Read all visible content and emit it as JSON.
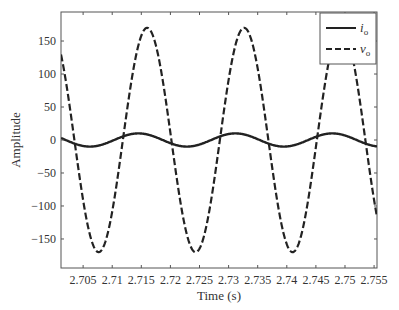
{
  "chart_data": {
    "type": "line",
    "title": "",
    "xlabel": "Time (s)",
    "ylabel": "Amplitude",
    "xlim": [
      2.7012,
      2.7555
    ],
    "ylim": [
      -194,
      194
    ],
    "grid": false,
    "legend_position": "upper right",
    "x_ticks": [
      2.705,
      2.71,
      2.715,
      2.72,
      2.725,
      2.73,
      2.735,
      2.74,
      2.745,
      2.75,
      2.755
    ],
    "x_tick_labels": [
      "2.705",
      "2.71",
      "2.715",
      "2.72",
      "2.725",
      "2.73",
      "2.735",
      "2.74",
      "2.745",
      "2.75",
      "2.755"
    ],
    "y_ticks": [
      150,
      100,
      50,
      0,
      -50,
      -100,
      -150
    ],
    "y_tick_labels": [
      "150",
      "100",
      "50",
      "0",
      "−50",
      "−100",
      "−150"
    ],
    "series": [
      {
        "name": "i_o",
        "legend_label": "i",
        "legend_sub": "o",
        "style": "solid",
        "color": "#222222",
        "waveform": {
          "amplitude": 10,
          "frequency_hz": 60,
          "peak_time": 2.7145
        },
        "x": [
          2.7012,
          2.7057,
          2.7099,
          2.7145,
          2.7187,
          2.7224,
          2.7266,
          2.7312,
          2.7354,
          2.7391,
          2.7433,
          2.7479,
          2.7521,
          2.7555
        ],
        "values": [
          0,
          -9.5,
          0,
          10,
          0,
          -10,
          0,
          10,
          0,
          -10,
          0,
          10,
          0,
          -9
        ]
      },
      {
        "name": "v_o",
        "legend_label": "v",
        "legend_sub": "o",
        "style": "dashed",
        "color": "#222222",
        "waveform": {
          "amplitude": 170,
          "frequency_hz": 60,
          "peak_time": 2.716
        },
        "x": [
          2.7012,
          2.7077,
          2.716,
          2.7243,
          2.7327,
          2.741,
          2.7493,
          2.7555
        ],
        "values": [
          130,
          -170,
          170,
          -170,
          170,
          -170,
          170,
          -120
        ]
      }
    ]
  }
}
